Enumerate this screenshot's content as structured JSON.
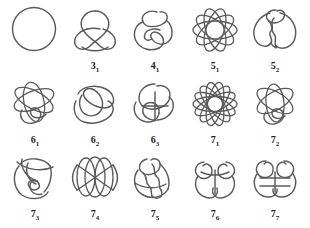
{
  "figure": {
    "background_color": "#ffffff",
    "stroke_color": "#5b5b5b",
    "label_color": "#232323",
    "rows": 3,
    "columns": 5
  },
  "knots": [
    {
      "id": "unknot",
      "label_main": "",
      "label_sub": "",
      "label_full": "",
      "crossings": 0,
      "row": 1,
      "col": 1,
      "art": "circle"
    },
    {
      "id": "3_1",
      "label_main": "3",
      "label_sub": "1",
      "label_full": "3₁",
      "crossings": 3,
      "row": 1,
      "col": 2,
      "art": "trefoil"
    },
    {
      "id": "4_1",
      "label_main": "4",
      "label_sub": "1",
      "label_full": "4₁",
      "crossings": 4,
      "row": 1,
      "col": 3,
      "art": "figure-eight"
    },
    {
      "id": "5_1",
      "label_main": "5",
      "label_sub": "1",
      "label_full": "5₁",
      "crossings": 5,
      "row": 1,
      "col": 4,
      "art": "rosette-5"
    },
    {
      "id": "5_2",
      "label_main": "5",
      "label_sub": "2",
      "label_full": "5₂",
      "crossings": 5,
      "row": 1,
      "col": 5,
      "art": "twist-5"
    },
    {
      "id": "6_1",
      "label_main": "6",
      "label_sub": "1",
      "label_full": "6₁",
      "crossings": 6,
      "row": 2,
      "col": 1,
      "art": "loop-6a"
    },
    {
      "id": "6_2",
      "label_main": "6",
      "label_sub": "2",
      "label_full": "6₂",
      "crossings": 6,
      "row": 2,
      "col": 2,
      "art": "loop-6b"
    },
    {
      "id": "6_3",
      "label_main": "6",
      "label_sub": "3",
      "label_full": "6₃",
      "crossings": 6,
      "row": 2,
      "col": 3,
      "art": "loop-6c"
    },
    {
      "id": "7_1",
      "label_main": "7",
      "label_sub": "1",
      "label_full": "7₁",
      "crossings": 7,
      "row": 2,
      "col": 4,
      "art": "rosette-7"
    },
    {
      "id": "7_2",
      "label_main": "7",
      "label_sub": "2",
      "label_full": "7₂",
      "crossings": 7,
      "row": 2,
      "col": 5,
      "art": "loop-7b"
    },
    {
      "id": "7_3",
      "label_main": "7",
      "label_sub": "3",
      "label_full": "7₃",
      "crossings": 7,
      "row": 3,
      "col": 1,
      "art": "loop-7c"
    },
    {
      "id": "7_4",
      "label_main": "7",
      "label_sub": "4",
      "label_full": "7₄",
      "crossings": 7,
      "row": 3,
      "col": 2,
      "art": "lens-7d"
    },
    {
      "id": "7_5",
      "label_main": "7",
      "label_sub": "5",
      "label_full": "7₅",
      "crossings": 7,
      "row": 3,
      "col": 3,
      "art": "loop-7e"
    },
    {
      "id": "7_6",
      "label_main": "7",
      "label_sub": "6",
      "label_full": "7₆",
      "crossings": 7,
      "row": 3,
      "col": 4,
      "art": "loop-7f"
    },
    {
      "id": "7_7",
      "label_main": "7",
      "label_sub": "7",
      "label_full": "7₇",
      "crossings": 7,
      "row": 3,
      "col": 5,
      "art": "loop-7g"
    }
  ]
}
